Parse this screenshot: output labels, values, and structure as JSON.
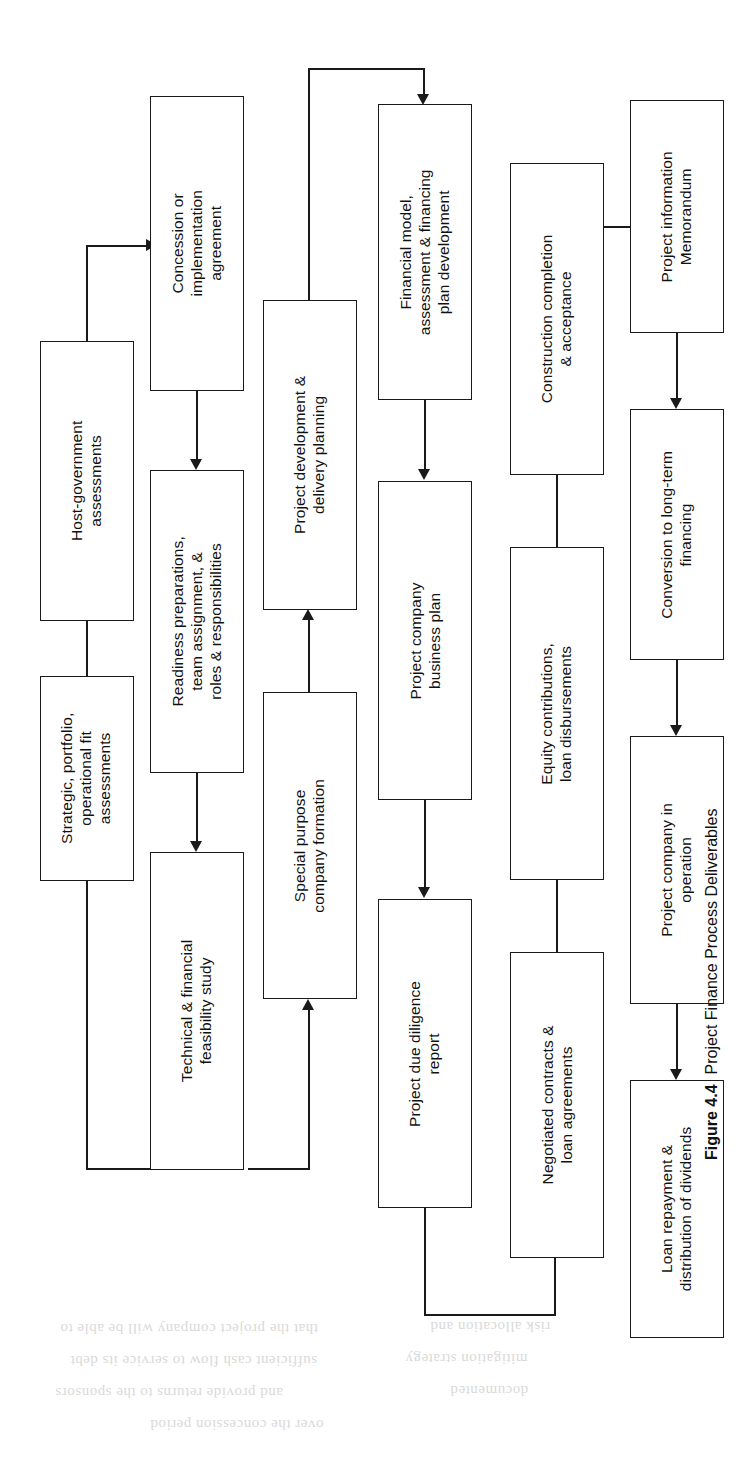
{
  "figure": {
    "number": "Figure 4.4",
    "title": "Project Finance Process Deliverables",
    "orientation": "rotated-90-ccw"
  },
  "nodes": [
    {
      "id": "host-government-assessments",
      "lines": [
        "Host-government",
        "assessments"
      ]
    },
    {
      "id": "strategic-portfolio-operational-fit-assessments",
      "lines": [
        "Strategic, portfolio,",
        "operational fit",
        "assessments"
      ]
    },
    {
      "id": "concession-or-implementation-agreement",
      "lines": [
        "Concession or",
        "implementation",
        "agreement"
      ]
    },
    {
      "id": "readiness-preparations-team-assignment-roles-responsibilities",
      "lines": [
        "Readiness preparations,",
        "team assignment, &",
        "roles & responsibilities"
      ]
    },
    {
      "id": "technical-financial-feasibility-study",
      "lines": [
        "Technical & financial",
        "feasibility study"
      ]
    },
    {
      "id": "project-development-delivery-planning",
      "lines": [
        "Project development &",
        "delivery planning"
      ]
    },
    {
      "id": "special-purpose-company-formation",
      "lines": [
        "Special purpose",
        "company formation"
      ]
    },
    {
      "id": "financial-model-assessment-financing-plan-development",
      "lines": [
        "Financial model,",
        "assessment & financing",
        "plan development"
      ]
    },
    {
      "id": "project-company-business-plan",
      "lines": [
        "Project company",
        "business plan"
      ]
    },
    {
      "id": "project-due-diligence-report",
      "lines": [
        "Project due diligence",
        "report"
      ]
    },
    {
      "id": "construction-completion-acceptance",
      "lines": [
        "Construction completion",
        "& acceptance"
      ]
    },
    {
      "id": "equity-contributions-loan-disbursements",
      "lines": [
        "Equity contributions,",
        "loan disbursements"
      ]
    },
    {
      "id": "negotiated-contracts-loan-agreements",
      "lines": [
        "Negotiated contracts &",
        "loan agreements"
      ]
    },
    {
      "id": "project-information-memorandum",
      "lines": [
        "Project information",
        "Memorandum"
      ]
    },
    {
      "id": "conversion-to-long-term-financing",
      "lines": [
        "Conversion to long-term",
        "financing"
      ]
    },
    {
      "id": "project-company-in-operation",
      "lines": [
        "Project company in",
        "operation"
      ]
    },
    {
      "id": "loan-repayment-distribution-of-dividends",
      "lines": [
        "Loan repayment &",
        "distribution of dividends"
      ]
    }
  ],
  "colors": {
    "stroke": "#1a1a1a",
    "fill": "#ffffff",
    "text": "#111111"
  }
}
